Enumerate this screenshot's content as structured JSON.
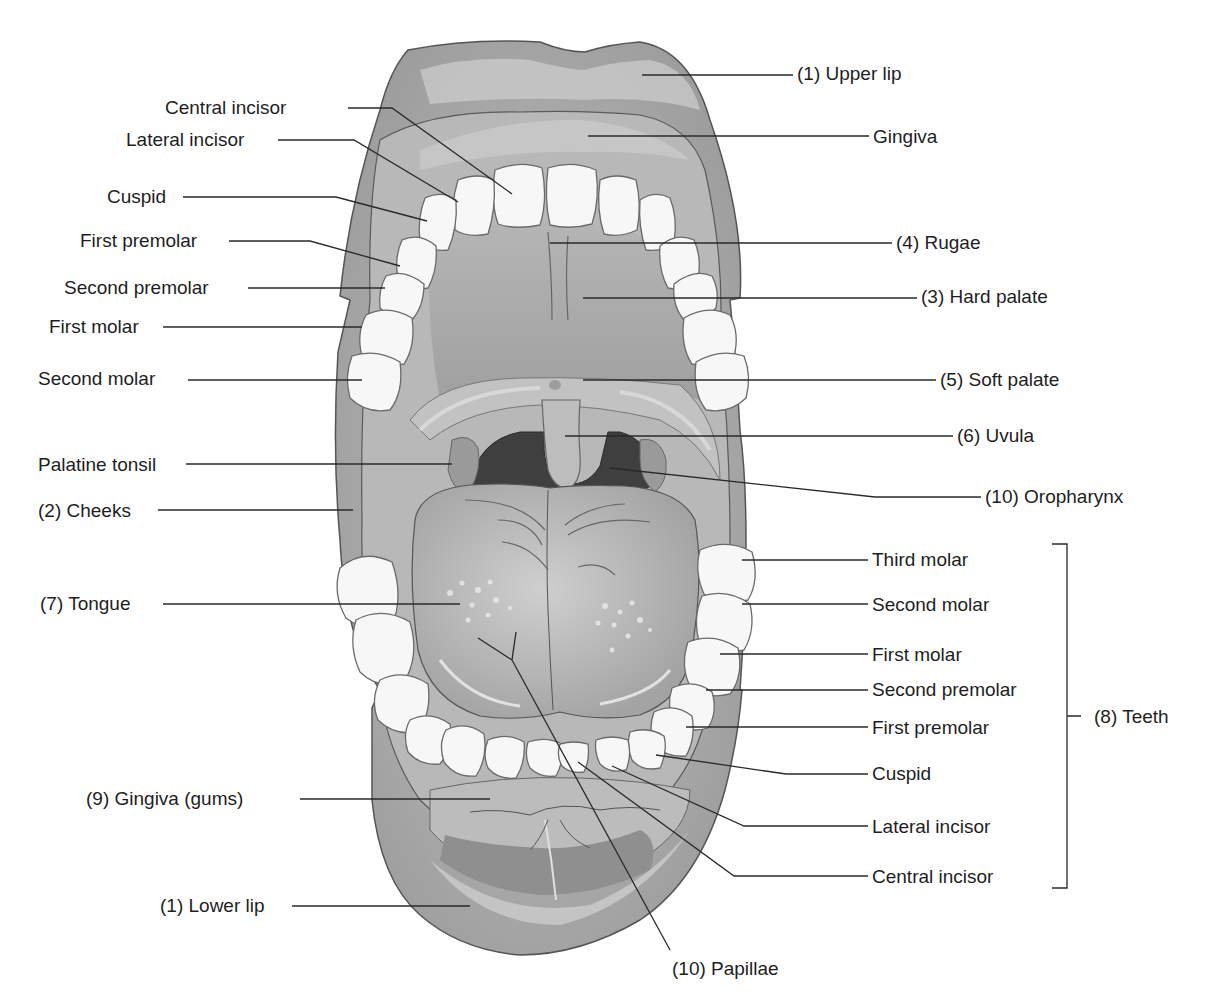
{
  "figure": {
    "colors": {
      "background": "#ffffff",
      "lip": "#a9a9a9",
      "lip_highlight": "#d6d6d6",
      "gingiva": "#bdbdbd",
      "palate": "#a5a5a5",
      "tooth": "#f7f7f7",
      "tooth_outline": "#6a6a6a",
      "oropharynx": "#3e3e3e",
      "tongue": "#b3b3b3",
      "leader_line": "#2a2a2a",
      "text": "#1e1e1e"
    }
  },
  "labels": [
    {
      "id": "central-incisor-upper",
      "text": "Central incisor",
      "x": 165,
      "y": 97,
      "side": "left",
      "line": [
        [
          348,
          108
        ],
        [
          392,
          108
        ],
        [
          512,
          194
        ]
      ]
    },
    {
      "id": "lateral-incisor-upper",
      "text": "Lateral incisor",
      "x": 126,
      "y": 129,
      "side": "left",
      "line": [
        [
          278,
          140
        ],
        [
          354,
          140
        ],
        [
          458,
          202
        ]
      ]
    },
    {
      "id": "cuspid-upper",
      "text": "Cuspid",
      "x": 107,
      "y": 186,
      "side": "left",
      "line": [
        [
          183,
          197
        ],
        [
          336,
          197
        ],
        [
          427,
          221
        ]
      ]
    },
    {
      "id": "first-premolar-upper",
      "text": "First premolar",
      "x": 80,
      "y": 230,
      "side": "left",
      "line": [
        [
          229,
          241
        ],
        [
          310,
          241
        ],
        [
          400,
          266
        ]
      ]
    },
    {
      "id": "second-premolar-upper",
      "text": "Second premolar",
      "x": 64,
      "y": 277,
      "side": "left",
      "line": [
        [
          248,
          288
        ],
        [
          385,
          288
        ]
      ]
    },
    {
      "id": "first-molar-upper",
      "text": "First molar",
      "x": 49,
      "y": 316,
      "side": "left",
      "line": [
        [
          163,
          327
        ],
        [
          362,
          327
        ]
      ]
    },
    {
      "id": "second-molar-upper",
      "text": "Second molar",
      "x": 38,
      "y": 368,
      "side": "left",
      "line": [
        [
          188,
          380
        ],
        [
          362,
          380
        ]
      ]
    },
    {
      "id": "palatine-tonsil",
      "text": "Palatine tonsil",
      "x": 38,
      "y": 454,
      "side": "left",
      "line": [
        [
          186,
          464
        ],
        [
          452,
          464
        ]
      ]
    },
    {
      "id": "cheeks",
      "text": "(2) Cheeks",
      "x": 38,
      "y": 500,
      "side": "left",
      "line": [
        [
          158,
          510
        ],
        [
          353,
          510
        ]
      ]
    },
    {
      "id": "tongue",
      "text": "(7) Tongue",
      "x": 40,
      "y": 593,
      "side": "left",
      "line": [
        [
          163,
          604
        ],
        [
          460,
          604
        ]
      ]
    },
    {
      "id": "gingiva-gums",
      "text": "(9) Gingiva (gums)",
      "x": 86,
      "y": 788,
      "side": "left",
      "line": [
        [
          300,
          799
        ],
        [
          490,
          799
        ]
      ]
    },
    {
      "id": "lower-lip",
      "text": "(1) Lower lip",
      "x": 160,
      "y": 895,
      "side": "left",
      "line": [
        [
          292,
          906
        ],
        [
          470,
          906
        ]
      ]
    },
    {
      "id": "upper-lip",
      "text": "(1) Upper lip",
      "x": 797,
      "y": 63,
      "side": "right",
      "line": [
        [
          642,
          75
        ],
        [
          793,
          75
        ]
      ]
    },
    {
      "id": "gingiva-upper",
      "text": "Gingiva",
      "x": 873,
      "y": 126,
      "side": "right",
      "line": [
        [
          588,
          136
        ],
        [
          869,
          136
        ]
      ]
    },
    {
      "id": "rugae",
      "text": "(4) Rugae",
      "x": 896,
      "y": 232,
      "side": "right",
      "line": [
        [
          550,
          243
        ],
        [
          892,
          243
        ]
      ]
    },
    {
      "id": "hard-palate",
      "text": "(3) Hard palate",
      "x": 921,
      "y": 286,
      "side": "right",
      "line": [
        [
          583,
          298
        ],
        [
          917,
          298
        ]
      ]
    },
    {
      "id": "soft-palate",
      "text": "(5) Soft palate",
      "x": 940,
      "y": 369,
      "side": "right",
      "line": [
        [
          583,
          380
        ],
        [
          936,
          380
        ]
      ]
    },
    {
      "id": "uvula",
      "text": "(6) Uvula",
      "x": 957,
      "y": 425,
      "side": "right",
      "line": [
        [
          565,
          436
        ],
        [
          953,
          436
        ]
      ]
    },
    {
      "id": "oropharynx",
      "text": "(10) Oropharynx",
      "x": 985,
      "y": 486,
      "side": "right",
      "line": [
        [
          610,
          468
        ],
        [
          875,
          497
        ],
        [
          981,
          497
        ]
      ]
    },
    {
      "id": "papillae",
      "text": "(10) Papillae",
      "x": 672,
      "y": 958,
      "side": "bottom",
      "line": [
        [
          478,
          638
        ],
        [
          512,
          660
        ],
        [
          516,
          632
        ],
        [
          512,
          660
        ],
        [
          670,
          950
        ]
      ]
    }
  ],
  "teeth_group": {
    "label": "(8) Teeth",
    "label_x": 1094,
    "label_y": 706,
    "bracket": {
      "x": 1067,
      "top": 544,
      "bottom": 888,
      "stub_y": 716,
      "cap": 15
    },
    "items": [
      {
        "id": "third-molar-lower",
        "text": "Third molar",
        "x": 872,
        "y": 549,
        "line": [
          [
            742,
            560
          ],
          [
            868,
            560
          ]
        ]
      },
      {
        "id": "second-molar-lower",
        "text": "Second molar",
        "x": 872,
        "y": 594,
        "line": [
          [
            742,
            604
          ],
          [
            868,
            604
          ]
        ]
      },
      {
        "id": "first-molar-lower",
        "text": "First molar",
        "x": 872,
        "y": 644,
        "line": [
          [
            720,
            654
          ],
          [
            868,
            654
          ]
        ]
      },
      {
        "id": "second-premolar-lower",
        "text": "Second premolar",
        "x": 872,
        "y": 679,
        "line": [
          [
            706,
            690
          ],
          [
            868,
            690
          ]
        ]
      },
      {
        "id": "first-premolar-lower",
        "text": "First premolar",
        "x": 872,
        "y": 717,
        "line": [
          [
            686,
            727
          ],
          [
            868,
            727
          ]
        ]
      },
      {
        "id": "cuspid-lower",
        "text": "Cuspid",
        "x": 872,
        "y": 763,
        "line": [
          [
            656,
            755
          ],
          [
            786,
            774
          ],
          [
            868,
            774
          ]
        ]
      },
      {
        "id": "lateral-incisor-lower",
        "text": "Lateral incisor",
        "x": 872,
        "y": 816,
        "line": [
          [
            612,
            766
          ],
          [
            744,
            826
          ],
          [
            868,
            826
          ]
        ]
      },
      {
        "id": "central-incisor-lower",
        "text": "Central incisor",
        "x": 872,
        "y": 866,
        "line": [
          [
            578,
            762
          ],
          [
            734,
            876
          ],
          [
            868,
            876
          ]
        ]
      }
    ]
  }
}
